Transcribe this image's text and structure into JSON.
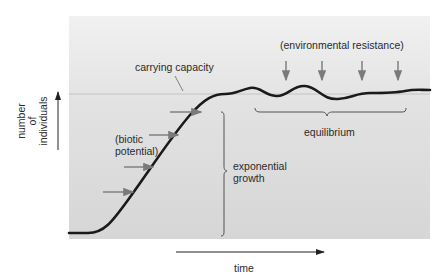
{
  "diagram": {
    "y_axis_label": [
      "number",
      "of",
      "individuals"
    ],
    "x_axis_label": "time",
    "annotations": {
      "carrying_capacity": "carrying capacity",
      "environmental_resistance": "(environmental resistance)",
      "biotic_potential_line1": "(biotic",
      "biotic_potential_line2": "potential)",
      "exponential_growth_line1": "exponential",
      "exponential_growth_line2": "growth",
      "equilibrium": "equilibrium"
    },
    "colors": {
      "curve": "#1a1a1a",
      "arrows": "#7a7a7a",
      "plot_background": "#dcdcdc",
      "carrying_capacity_line": "#c8c8c8"
    },
    "counts": {
      "biotic_potential_arrows": 4,
      "environmental_resistance_arrows": 4
    }
  }
}
